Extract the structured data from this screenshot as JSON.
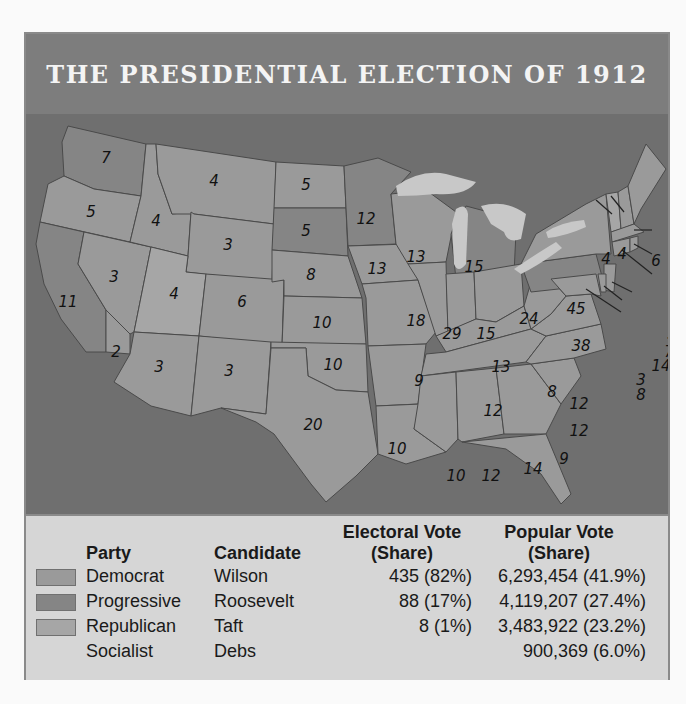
{
  "title": "THE PRESIDENTIAL ELECTION OF 1912",
  "colors": {
    "democrat": "#9a9a9a",
    "progressive": "#858585",
    "republican": "#a6a6a6",
    "water": "#6f6f6f",
    "title_bar": "#7d7d7d",
    "legend_bg": "#d6d6d6"
  },
  "legend": {
    "headers": {
      "party": "Party",
      "candidate": "Candidate",
      "electoral_line1": "Electoral Vote",
      "electoral_line2": "(Share)",
      "popular_line1": "Popular Vote",
      "popular_line2": "(Share)"
    },
    "rows": [
      {
        "party": "Democrat",
        "candidate": "Wilson",
        "electoral": "435 (82%)",
        "popular": "6,293,454 (41.9%)",
        "swatch": "democrat"
      },
      {
        "party": "Progressive",
        "candidate": "Roosevelt",
        "electoral": "88 (17%)",
        "popular": "4,119,207 (27.4%)",
        "swatch": "progressive"
      },
      {
        "party": "Republican",
        "candidate": "Taft",
        "electoral": "8 (1%)",
        "popular": "3,483,922 (23.2%)",
        "swatch": "republican"
      },
      {
        "party": "Socialist",
        "candidate": "Debs",
        "electoral": "",
        "popular": "900,369 (6.0%)",
        "swatch": null
      }
    ]
  },
  "map": {
    "states": [
      {
        "abbr": "WA",
        "votes": "7",
        "party": "progressive"
      },
      {
        "abbr": "OR",
        "votes": "5",
        "party": "democrat"
      },
      {
        "abbr": "CA",
        "votes": "11",
        "party": "progressive"
      },
      {
        "abbr": "CA-S",
        "votes": "2",
        "party": "democrat"
      },
      {
        "abbr": "ID",
        "votes": "4",
        "party": "democrat"
      },
      {
        "abbr": "NV",
        "votes": "3",
        "party": "democrat"
      },
      {
        "abbr": "MT",
        "votes": "4",
        "party": "democrat"
      },
      {
        "abbr": "WY",
        "votes": "3",
        "party": "democrat"
      },
      {
        "abbr": "UT",
        "votes": "4",
        "party": "republican"
      },
      {
        "abbr": "AZ",
        "votes": "3",
        "party": "democrat"
      },
      {
        "abbr": "CO",
        "votes": "6",
        "party": "democrat"
      },
      {
        "abbr": "NM",
        "votes": "3",
        "party": "democrat"
      },
      {
        "abbr": "ND",
        "votes": "5",
        "party": "democrat"
      },
      {
        "abbr": "SD",
        "votes": "5",
        "party": "progressive"
      },
      {
        "abbr": "NE",
        "votes": "8",
        "party": "democrat"
      },
      {
        "abbr": "KS",
        "votes": "10",
        "party": "democrat"
      },
      {
        "abbr": "OK",
        "votes": "10",
        "party": "democrat"
      },
      {
        "abbr": "TX",
        "votes": "20",
        "party": "democrat"
      },
      {
        "abbr": "MN",
        "votes": "12",
        "party": "progressive"
      },
      {
        "abbr": "IA",
        "votes": "13",
        "party": "democrat"
      },
      {
        "abbr": "MO",
        "votes": "18",
        "party": "democrat"
      },
      {
        "abbr": "AR",
        "votes": "9",
        "party": "democrat"
      },
      {
        "abbr": "LA",
        "votes": "10",
        "party": "democrat"
      },
      {
        "abbr": "WI",
        "votes": "13",
        "party": "democrat"
      },
      {
        "abbr": "IL",
        "votes": "29",
        "party": "democrat"
      },
      {
        "abbr": "MI",
        "votes": "15",
        "party": "progressive"
      },
      {
        "abbr": "IN",
        "votes": "15",
        "party": "democrat"
      },
      {
        "abbr": "OH",
        "votes": "24",
        "party": "democrat"
      },
      {
        "abbr": "KY",
        "votes": "13",
        "party": "democrat"
      },
      {
        "abbr": "TN",
        "votes": "12",
        "party": "democrat"
      },
      {
        "abbr": "MS",
        "votes": "10",
        "party": "democrat"
      },
      {
        "abbr": "AL",
        "votes": "12",
        "party": "democrat"
      },
      {
        "abbr": "GA",
        "votes": "14",
        "party": "democrat"
      },
      {
        "abbr": "FL",
        "votes": "6",
        "party": "democrat"
      },
      {
        "abbr": "SC",
        "votes": "9",
        "party": "democrat"
      },
      {
        "abbr": "NC",
        "votes": "12",
        "party": "democrat"
      },
      {
        "abbr": "VA",
        "votes": "12",
        "party": "democrat"
      },
      {
        "abbr": "WV",
        "votes": "8",
        "party": "democrat"
      },
      {
        "abbr": "PA",
        "votes": "38",
        "party": "progressive"
      },
      {
        "abbr": "NY",
        "votes": "45",
        "party": "democrat"
      },
      {
        "abbr": "VT",
        "votes": "4",
        "party": "republican"
      },
      {
        "abbr": "NH",
        "votes": "4",
        "party": "democrat"
      },
      {
        "abbr": "ME",
        "votes": "6",
        "party": "democrat"
      },
      {
        "abbr": "MA",
        "votes": "18",
        "party": "democrat"
      },
      {
        "abbr": "RI",
        "votes": "5",
        "party": "democrat"
      },
      {
        "abbr": "CT",
        "votes": "7",
        "party": "democrat"
      },
      {
        "abbr": "NJ",
        "votes": "14",
        "party": "democrat"
      },
      {
        "abbr": "DE",
        "votes": "3",
        "party": "democrat"
      },
      {
        "abbr": "MD",
        "votes": "8",
        "party": "democrat"
      }
    ]
  }
}
